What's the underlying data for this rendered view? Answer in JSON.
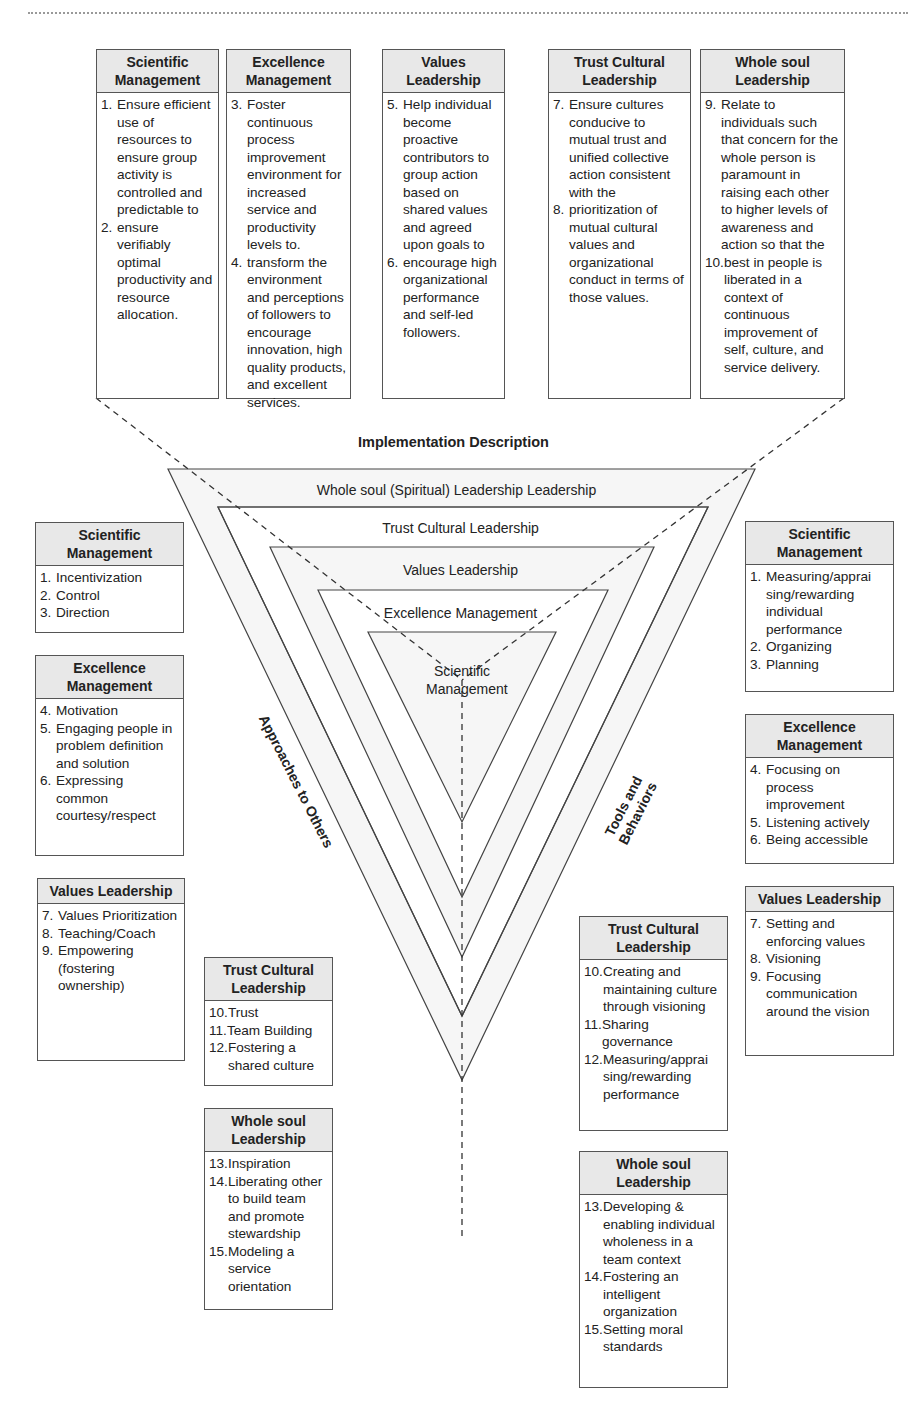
{
  "diagram": {
    "implementation_title": "Implementation Description",
    "layers": [
      "Whole soul (Spiritual) Leadership Leadership",
      "Trust Cultural Leadership",
      "Values Leadership",
      "Excellence Management",
      "Scientific Management"
    ],
    "left_axis_label": "Approaches to Others",
    "right_axis_label": "Tools and Behaviors",
    "colors": {
      "line": "#444444",
      "header_fill": "#e8e8e8",
      "border": "#555555"
    }
  },
  "top_boxes": [
    {
      "title": "Scientific Management",
      "items": [
        {
          "n": "1.",
          "t": "Ensure efficient use of resources to ensure group activity is controlled and predictable to"
        },
        {
          "n": "2.",
          "t": "ensure verifiably optimal productivity and resource allocation."
        }
      ]
    },
    {
      "title": "Excellence Management",
      "items": [
        {
          "n": "3.",
          "t": "Foster continuous process improvement environment for increased service and productivity levels to."
        },
        {
          "n": "4.",
          "t": "transform the environment and perceptions of followers to encourage innovation, high quality products, and excellent services."
        }
      ]
    },
    {
      "title": "Values Leadership",
      "items": [
        {
          "n": "5.",
          "t": "Help individual become proactive contributors to group action based on shared values and agreed upon goals to"
        },
        {
          "n": "6.",
          "t": "encourage high organizational performance and self-led followers."
        }
      ]
    },
    {
      "title": "Trust Cultural Leadership",
      "items": [
        {
          "n": "7.",
          "t": "Ensure cultures conducive to mutual trust and unified collective action consistent with the"
        },
        {
          "n": "8.",
          "t": "prioritization of mutual cultural values and organizational conduct in terms of those values."
        }
      ]
    },
    {
      "title": "Whole soul Leadership",
      "items": [
        {
          "n": "9.",
          "t": "Relate to individuals such that concern for the whole person is paramount in raising each other to higher levels of awareness and action so that the"
        },
        {
          "n": "10.",
          "t": "best in people is liberated in a context of continuous improvement of self, culture, and service delivery."
        }
      ]
    }
  ],
  "left_boxes": [
    {
      "title": "Scientific Management",
      "items": [
        {
          "n": "1.",
          "t": "Incentivization"
        },
        {
          "n": "2.",
          "t": "Control"
        },
        {
          "n": "3.",
          "t": "Direction"
        }
      ]
    },
    {
      "title": "Excellence Management",
      "items": [
        {
          "n": "4.",
          "t": "Motivation"
        },
        {
          "n": "5.",
          "t": "Engaging people in problem definition and solution"
        },
        {
          "n": "6.",
          "t": "Expressing common courtesy/respect"
        }
      ]
    },
    {
      "title": "Values Leadership",
      "items": [
        {
          "n": "7.",
          "t": "Values Prioritization"
        },
        {
          "n": "8.",
          "t": "Teaching/Coach"
        },
        {
          "n": "9.",
          "t": "Empowering (fostering ownership)"
        }
      ]
    },
    {
      "title": "Trust Cultural Leadership",
      "items": [
        {
          "n": "10.",
          "t": "Trust"
        },
        {
          "n": "11.",
          "t": "Team Building"
        },
        {
          "n": "12.",
          "t": "Fostering a shared culture"
        }
      ]
    },
    {
      "title": "Whole soul Leadership",
      "items": [
        {
          "n": "13.",
          "t": "Inspiration"
        },
        {
          "n": "14.",
          "t": "Liberating other to build team and promote stewardship"
        },
        {
          "n": "15.",
          "t": "Modeling a service orientation"
        }
      ]
    }
  ],
  "right_boxes": [
    {
      "title": "Scientific Management",
      "items": [
        {
          "n": "1.",
          "t": "Measuring/apprai sing/rewarding individual performance"
        },
        {
          "n": "2.",
          "t": "Organizing"
        },
        {
          "n": "3.",
          "t": "Planning"
        }
      ]
    },
    {
      "title": "Excellence Management",
      "items": [
        {
          "n": "4.",
          "t": "Focusing on process improvement"
        },
        {
          "n": "5.",
          "t": "Listening actively"
        },
        {
          "n": "6.",
          "t": "Being accessible"
        }
      ]
    },
    {
      "title": "Values Leadership",
      "items": [
        {
          "n": "7.",
          "t": "Setting and enforcing values"
        },
        {
          "n": "8.",
          "t": "Visioning"
        },
        {
          "n": "9.",
          "t": "Focusing communication around the vision"
        }
      ]
    },
    {
      "title": "Trust Cultural Leadership",
      "items": [
        {
          "n": "10.",
          "t": "Creating and maintaining culture through visioning"
        },
        {
          "n": "11.",
          "t": "Sharing governance"
        },
        {
          "n": "12.",
          "t": "Measuring/apprai sing/rewarding performance"
        }
      ]
    },
    {
      "title": "Whole soul Leadership",
      "items": [
        {
          "n": "13.",
          "t": "Developing & enabling individual wholeness in a team context"
        },
        {
          "n": "14.",
          "t": "Fostering an intelligent organization"
        },
        {
          "n": "15.",
          "t": "Setting moral standards"
        }
      ]
    }
  ]
}
